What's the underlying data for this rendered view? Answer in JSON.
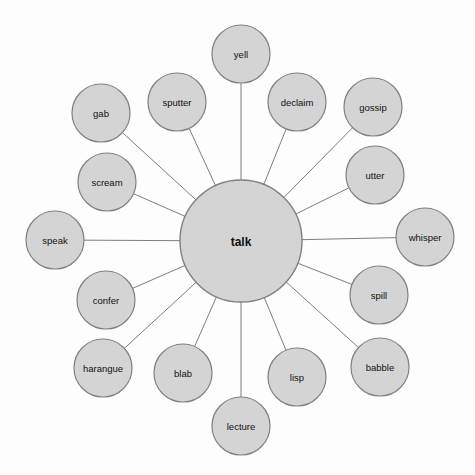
{
  "diagram": {
    "type": "radial-word-web",
    "canvas": {
      "width": 475,
      "height": 475
    },
    "style": {
      "background_color": "#fdfdfd",
      "node_fill": "#d4d4d4",
      "node_stroke": "#808080",
      "edge_stroke": "#7d7d7d",
      "label_color": "#111111"
    },
    "center": {
      "label": "talk",
      "cx": 241,
      "cy": 241,
      "r": 61,
      "bold": true
    },
    "satellite_radius": 29,
    "nodes": [
      {
        "label": "yell",
        "cx": 241,
        "cy": 54,
        "r": 29
      },
      {
        "label": "declaim",
        "cx": 297,
        "cy": 102,
        "r": 29
      },
      {
        "label": "gossip",
        "cx": 373,
        "cy": 107,
        "r": 29
      },
      {
        "label": "utter",
        "cx": 375,
        "cy": 175,
        "r": 29
      },
      {
        "label": "whisper",
        "cx": 425,
        "cy": 237,
        "r": 29
      },
      {
        "label": "spill",
        "cx": 379,
        "cy": 295,
        "r": 29
      },
      {
        "label": "babble",
        "cx": 380,
        "cy": 367,
        "r": 29
      },
      {
        "label": "lisp",
        "cx": 297,
        "cy": 377,
        "r": 29
      },
      {
        "label": "lecture",
        "cx": 241,
        "cy": 426,
        "r": 29
      },
      {
        "label": "blab",
        "cx": 183,
        "cy": 373,
        "r": 29
      },
      {
        "label": "harangue",
        "cx": 103,
        "cy": 368,
        "r": 29
      },
      {
        "label": "confer",
        "cx": 106,
        "cy": 300,
        "r": 29
      },
      {
        "label": "speak",
        "cx": 55,
        "cy": 240,
        "r": 29
      },
      {
        "label": "scream",
        "cx": 107,
        "cy": 182,
        "r": 29
      },
      {
        "label": "gab",
        "cx": 101,
        "cy": 113,
        "r": 29
      },
      {
        "label": "sputter",
        "cx": 177,
        "cy": 102,
        "r": 29
      }
    ],
    "edges": [
      {
        "from": "talk",
        "to": "yell"
      },
      {
        "from": "talk",
        "to": "declaim"
      },
      {
        "from": "talk",
        "to": "gossip"
      },
      {
        "from": "talk",
        "to": "utter"
      },
      {
        "from": "talk",
        "to": "whisper"
      },
      {
        "from": "talk",
        "to": "spill"
      },
      {
        "from": "talk",
        "to": "babble"
      },
      {
        "from": "talk",
        "to": "lisp"
      },
      {
        "from": "talk",
        "to": "lecture"
      },
      {
        "from": "talk",
        "to": "blab"
      },
      {
        "from": "talk",
        "to": "harangue"
      },
      {
        "from": "talk",
        "to": "confer"
      },
      {
        "from": "talk",
        "to": "speak"
      },
      {
        "from": "talk",
        "to": "scream"
      },
      {
        "from": "talk",
        "to": "gab"
      },
      {
        "from": "talk",
        "to": "sputter"
      }
    ]
  }
}
